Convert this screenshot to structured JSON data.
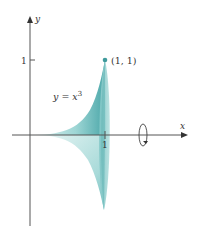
{
  "figure": {
    "axes": {
      "x_label": "x",
      "y_label": "y",
      "x_tick": "1",
      "y_tick": "1"
    },
    "curve_label": {
      "prefix": "y = x",
      "exponent": "3"
    },
    "point_label": "(1, 1)",
    "rotation_axis": "x",
    "colors": {
      "solid_light": "#cfe9e8",
      "solid_mid": "#8ccfcf",
      "solid_dark": "#4aa6a8",
      "face": "#a9d9d8",
      "axis": "#555555"
    }
  }
}
